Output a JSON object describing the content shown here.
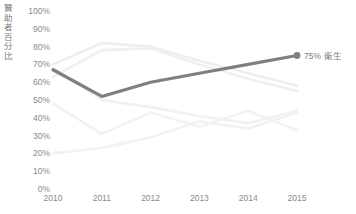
{
  "chart_data": {
    "type": "line",
    "title": "",
    "xlabel": "",
    "ylabel": "贊助者百分比",
    "categories": [
      "2010",
      "2011",
      "2012",
      "2013",
      "2014",
      "2015"
    ],
    "x": [
      2010,
      2011,
      2012,
      2013,
      2014,
      2015
    ],
    "ylim": [
      0,
      100
    ],
    "yticks": [
      "0%",
      "10%",
      "20%",
      "30%",
      "40%",
      "50%",
      "60%",
      "70%",
      "80%",
      "90%",
      "100%"
    ],
    "ytick_values": [
      0,
      10,
      20,
      30,
      40,
      50,
      60,
      70,
      80,
      90,
      100
    ],
    "grid": false,
    "legend": "none",
    "highlight_series": "衛生",
    "series": [
      {
        "name": "衛生",
        "highlighted": true,
        "color": "#808080",
        "values": [
          67,
          52,
          60,
          65,
          70,
          75
        ],
        "end_label": "75% 衛生",
        "end_value_label": "75%",
        "end_name_label": "衛生",
        "marker_at_end": true
      },
      {
        "name": "series-2",
        "highlighted": false,
        "color": "#eeeeee",
        "values": [
          70,
          82,
          80,
          72,
          65,
          58
        ]
      },
      {
        "name": "series-3",
        "highlighted": false,
        "color": "#f0f0f0",
        "values": [
          63,
          78,
          79,
          70,
          62,
          55
        ]
      },
      {
        "name": "series-4",
        "highlighted": false,
        "color": "#f1f1f1",
        "values": [
          68,
          50,
          46,
          41,
          37,
          44
        ]
      },
      {
        "name": "series-5",
        "highlighted": false,
        "color": "#f2f2f2",
        "values": [
          48,
          31,
          43,
          35,
          44,
          33
        ]
      },
      {
        "name": "series-6",
        "highlighted": false,
        "color": "#f2f2f2",
        "values": [
          20,
          23,
          29,
          38,
          34,
          43
        ]
      }
    ]
  },
  "annotations": {
    "endpoint_value": "75%",
    "endpoint_series": "衛生"
  },
  "colors": {
    "highlight_line": "#808080",
    "muted_line": "#f0f0f0",
    "tick_text": "#8a8a8a",
    "axis_title_text": "#7a7a7a",
    "background": "#ffffff"
  }
}
